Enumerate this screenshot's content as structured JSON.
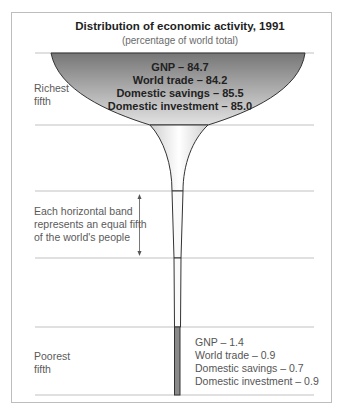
{
  "chart_data": {
    "type": "funnel",
    "title": "Distribution of economic activity, 1991",
    "subtitle": "(percentage of world total)",
    "bands": [
      "Richest fifth",
      "Second fifth",
      "Third fifth",
      "Fourth fifth",
      "Poorest fifth"
    ],
    "band_labels": {
      "richest": [
        "Richest",
        "fifth"
      ],
      "poorest": [
        "Poorest",
        "fifth"
      ]
    },
    "annotation": {
      "lines": [
        "Each horizontal band",
        "represents an equal fifth",
        "of the world's people"
      ]
    },
    "richest_fifth": {
      "GNP": 84.7,
      "World trade": 84.2,
      "Domestic savings": 85.5,
      "Domestic investment": 85.0
    },
    "poorest_fifth": {
      "GNP": 1.4,
      "World trade": 0.9,
      "Domestic savings": 0.7,
      "Domestic investment": 0.9
    },
    "richest_labels": [
      "GNP – 84.7",
      "World trade – 84.2",
      "Domestic savings – 85.5",
      "Domestic investment – 85.0"
    ],
    "poorest_labels": [
      "GNP – 1.4",
      "World trade – 0.9",
      "Domestic savings – 0.7",
      "Domestic investment – 0.9"
    ],
    "colors": {
      "top_dark": "#7d7d7d",
      "top_light": "#dcdcdc",
      "neck_light": "#f4f4f4",
      "outline": "#333333",
      "poorest_fill": "#8a8a8a"
    }
  }
}
